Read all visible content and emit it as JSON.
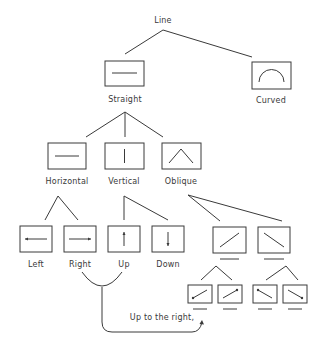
{
  "diagram": {
    "type": "taxonomy-tree",
    "root": {
      "label": "Line"
    },
    "nodes": {
      "straight": {
        "label": "Straight",
        "icon": "horizontal-line"
      },
      "curved": {
        "label": "Curved",
        "icon": "arc"
      },
      "horizontal": {
        "label": "Horizontal",
        "icon": "horizontal-line"
      },
      "vertical": {
        "label": "Vertical",
        "icon": "vertical-line"
      },
      "oblique": {
        "label": "Oblique",
        "icon": "caret"
      },
      "left": {
        "label": "Left",
        "icon": "arrow-left-line"
      },
      "right": {
        "label": "Right",
        "icon": "arrow-right-line"
      },
      "up": {
        "label": "Up",
        "icon": "arrow-up-line"
      },
      "down": {
        "label": "Down",
        "icon": "arrow-down-line"
      },
      "oblique_rising": {
        "label": "",
        "icon": "rising-diagonal"
      },
      "oblique_falling": {
        "label": "",
        "icon": "falling-diagonal"
      },
      "rising_a": {
        "label": "",
        "icon": "rising-diagonal-dot-start"
      },
      "rising_b": {
        "label": "",
        "icon": "rising-diagonal-dot-end"
      },
      "falling_a": {
        "label": "",
        "icon": "falling-diagonal-dot-start"
      },
      "falling_b": {
        "label": "",
        "icon": "falling-diagonal-dot-end"
      }
    },
    "annotation": {
      "label": "Up to the right,",
      "combines": [
        "Right",
        "Up"
      ]
    }
  }
}
